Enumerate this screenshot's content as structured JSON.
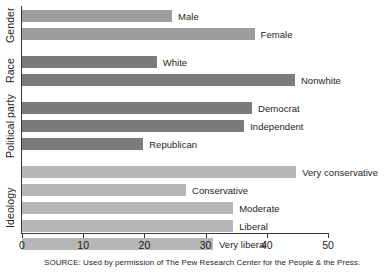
{
  "chart_data": {
    "type": "bar",
    "orientation": "horizontal",
    "title": "",
    "xlabel": "",
    "ylabel": "",
    "xlim": [
      0,
      50
    ],
    "xticks": [
      0,
      10,
      20,
      30,
      40,
      50
    ],
    "xtick_labels": [
      "0",
      "10",
      "20",
      "30",
      "40",
      "50"
    ],
    "grid": false,
    "legend": "none",
    "groups": [
      {
        "name": "Gender",
        "label": "Gender",
        "color": "#9d9d9d",
        "categories": [
          "Male",
          "Female"
        ],
        "values": [
          24.5,
          38.0
        ]
      },
      {
        "name": "Race",
        "label": "Race",
        "color": "#7a7a7a",
        "categories": [
          "White",
          "Nonwhite"
        ],
        "values": [
          22.0,
          44.6
        ]
      },
      {
        "name": "Political party",
        "label": "Political party",
        "color": "#7a7a7a",
        "categories": [
          "Democrat",
          "Independent",
          "Republican"
        ],
        "values": [
          37.6,
          36.3,
          19.8
        ]
      },
      {
        "name": "Ideology",
        "label": "Ideology",
        "color": "#b7b7b7",
        "categories": [
          "Very conservative",
          "Conservative",
          "Moderate",
          "Liberal",
          "Very liberal"
        ],
        "values": [
          44.8,
          26.8,
          34.5,
          34.5,
          31.2
        ]
      }
    ],
    "bars": [
      {
        "label": "Male",
        "value": 24.5,
        "group": "Gender",
        "color": "#9d9d9d"
      },
      {
        "label": "Female",
        "value": 38.0,
        "group": "Gender",
        "color": "#9d9d9d"
      },
      {
        "label": "White",
        "value": 22.0,
        "group": "Race",
        "color": "#7a7a7a"
      },
      {
        "label": "Nonwhite",
        "value": 44.6,
        "group": "Race",
        "color": "#7a7a7a"
      },
      {
        "label": "Democrat",
        "value": 37.6,
        "group": "Political party",
        "color": "#7a7a7a"
      },
      {
        "label": "Independent",
        "value": 36.3,
        "group": "Political party",
        "color": "#7a7a7a"
      },
      {
        "label": "Republican",
        "value": 19.8,
        "group": "Political party",
        "color": "#7a7a7a"
      },
      {
        "label": "Very conservative",
        "value": 44.8,
        "group": "Ideology",
        "color": "#b7b7b7"
      },
      {
        "label": "Conservative",
        "value": 26.8,
        "group": "Ideology",
        "color": "#b7b7b7"
      },
      {
        "label": "Moderate",
        "value": 34.5,
        "group": "Ideology",
        "color": "#b7b7b7"
      },
      {
        "label": "Liberal",
        "value": 34.5,
        "group": "Ideology",
        "color": "#b7b7b7"
      },
      {
        "label": "Very liberal",
        "value": 31.2,
        "group": "Ideology",
        "color": "#b7b7b7"
      }
    ]
  },
  "axis": {
    "group_labels": [
      "Gender",
      "Race",
      "Political party",
      "Ideology"
    ]
  },
  "footer": {
    "source": "SOURCE: Used by permission of The Pew Research Center for the People & the Press."
  },
  "colors": {
    "bar_light": "#b7b7b7",
    "bar_medium": "#9d9d9d",
    "bar_dark": "#7a7a7a",
    "axis": "#3a3a3a",
    "text": "#231f20",
    "background": "#ffffff"
  }
}
